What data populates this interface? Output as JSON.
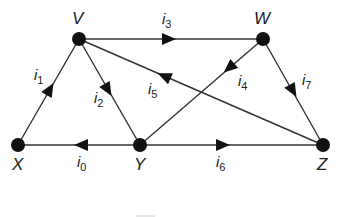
{
  "diagram": {
    "type": "directed-graph",
    "nodes": [
      {
        "id": "V",
        "label": "V",
        "x": 79,
        "y": 39
      },
      {
        "id": "W",
        "label": "W",
        "x": 263,
        "y": 39
      },
      {
        "id": "X",
        "label": "X",
        "x": 18,
        "y": 145
      },
      {
        "id": "Y",
        "label": "Y",
        "x": 140,
        "y": 145
      },
      {
        "id": "Z",
        "label": "Z",
        "x": 323,
        "y": 145
      }
    ],
    "edges": [
      {
        "id": "i0",
        "label": "i",
        "sub": "0",
        "from": "Y",
        "to": "X"
      },
      {
        "id": "i1",
        "label": "i",
        "sub": "1",
        "from": "X",
        "to": "V"
      },
      {
        "id": "i2",
        "label": "i",
        "sub": "2",
        "from": "V",
        "to": "Y"
      },
      {
        "id": "i3",
        "label": "i",
        "sub": "3",
        "from": "V",
        "to": "W"
      },
      {
        "id": "i4",
        "label": "i",
        "sub": "4",
        "from": "W",
        "to": "Y"
      },
      {
        "id": "i5",
        "label": "i",
        "sub": "5",
        "from": "Z",
        "to": "V"
      },
      {
        "id": "i6",
        "label": "i",
        "sub": "6",
        "from": "Y",
        "to": "Z"
      },
      {
        "id": "i7",
        "label": "i",
        "sub": "7",
        "from": "W",
        "to": "Z"
      }
    ]
  },
  "labels": {
    "V": "V",
    "W": "W",
    "X": "X",
    "Y": "Y",
    "Z": "Z",
    "i": "i",
    "s0": "0",
    "s1": "1",
    "s2": "2",
    "s3": "3",
    "s4": "4",
    "s5": "5",
    "s6": "6",
    "s7": "7"
  }
}
